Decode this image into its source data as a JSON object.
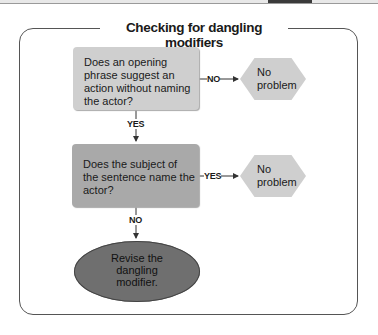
{
  "title": "Checking for dangling modifiers",
  "nodes": {
    "question1": "Does an opening phrase suggest an action without naming the actor?",
    "question1_lines": [
      "Does an opening",
      "phrase suggest an",
      "action without naming",
      "the actor?"
    ],
    "question2_lines": [
      "Does the subject of",
      "the sentence name the",
      "actor?"
    ],
    "result1_lines": [
      "No",
      "problem"
    ],
    "result2_lines": [
      "No",
      "problem"
    ],
    "action_lines": [
      "Revise the",
      "dangling",
      "modifier."
    ]
  },
  "edges": {
    "q1_no": "NO",
    "q1_yes": "YES",
    "q2_yes": "YES",
    "q2_no": "NO"
  },
  "colors": {
    "question1_fill": "#cfcfcf",
    "question2_fill": "#a9a9a9",
    "hexagon_fill": "#cfcfcf",
    "oval_fill": "#6f6f6f",
    "frame_stroke": "#555555"
  }
}
